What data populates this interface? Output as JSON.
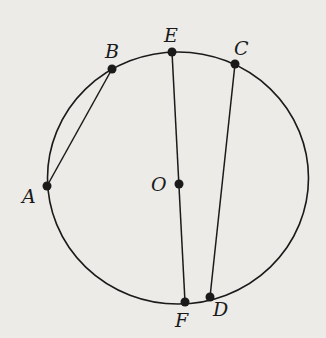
{
  "diagram": {
    "type": "circle-geometry",
    "circle": {
      "center_label": "O"
    },
    "points": [
      {
        "label": "A",
        "x": 47,
        "y": 186,
        "lx": 22,
        "ly": 203
      },
      {
        "label": "B",
        "x": 112,
        "y": 69,
        "lx": 105,
        "ly": 58
      },
      {
        "label": "E",
        "x": 172,
        "y": 52,
        "lx": 164,
        "ly": 42
      },
      {
        "label": "C",
        "x": 235,
        "y": 64,
        "lx": 234,
        "ly": 55
      },
      {
        "label": "O",
        "x": 179,
        "y": 184,
        "lx": 151,
        "ly": 191
      },
      {
        "label": "F",
        "x": 185,
        "y": 302,
        "lx": 175,
        "ly": 327
      },
      {
        "label": "D",
        "x": 210,
        "y": 297,
        "lx": 213,
        "ly": 316
      }
    ],
    "segments": [
      {
        "from": "A",
        "to": "B"
      },
      {
        "from": "E",
        "to": "F"
      },
      {
        "from": "C",
        "to": "D"
      }
    ],
    "colors": {
      "background": "#ecebe8",
      "ink": "#1a1a1a"
    }
  }
}
